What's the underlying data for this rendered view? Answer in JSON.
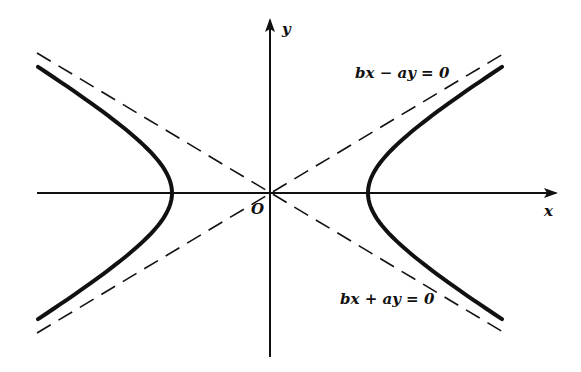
{
  "figure": {
    "origin_label": "O",
    "x_axis_label": "x",
    "y_axis_label": "y",
    "asymptote_upper_label": "bx − ay = 0",
    "asymptote_lower_label": "bx + ay = 0",
    "colors": {
      "ink": "#111111",
      "background": "#ffffff"
    },
    "geometry": {
      "origin_px": [
        270,
        193
      ],
      "a_px": 98,
      "b_over_a": 0.6,
      "curve_style": "solid-thick",
      "asymptote_style": "dashed"
    }
  }
}
